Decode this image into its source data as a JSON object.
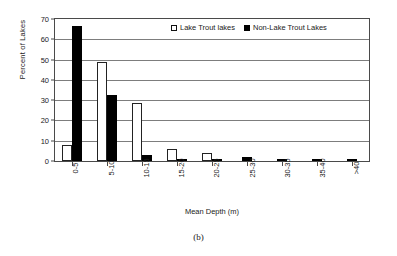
{
  "caption": "(b)",
  "legend": {
    "position": "top-center-inside",
    "entries": [
      {
        "label": "Lake Trout lakes",
        "swatch": "white-square"
      },
      {
        "label": "Non-Lake Trout Lakes",
        "swatch": "black-square"
      }
    ]
  },
  "chart_data": {
    "type": "bar",
    "title": "",
    "xlabel": "Mean Depth (m)",
    "ylabel": "Percent of Lakes",
    "categories": [
      "0-5",
      "5-10",
      "10-15",
      "15-20",
      "20-25",
      "25-30",
      "30-35",
      "35-40",
      ">40"
    ],
    "series": [
      {
        "name": "Lake Trout lakes",
        "color": "#ffffff",
        "edge_color": "#222222",
        "values": [
          8,
          48,
          28,
          6,
          4,
          0,
          0,
          0,
          0
        ]
      },
      {
        "name": "Non-Lake Trout Lakes",
        "color": "#000000",
        "edge_color": "#000000",
        "values": [
          65.5,
          32,
          3,
          1,
          1,
          2,
          1,
          1,
          1
        ]
      }
    ],
    "ylim": [
      0,
      70
    ],
    "yticks": [
      0,
      10,
      20,
      30,
      40,
      50,
      60,
      70
    ],
    "ytick_labels": [
      "0",
      "10",
      "20",
      "30",
      "40",
      "50",
      "60",
      "70"
    ],
    "grid": "horizontal",
    "legend_position": "upper center"
  }
}
